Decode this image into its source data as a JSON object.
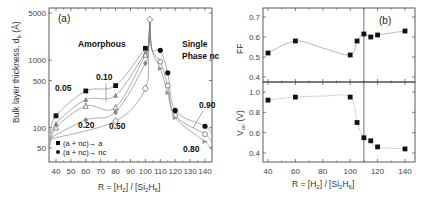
{
  "chart_data": [
    {
      "id": "a",
      "type": "line",
      "panel_label": "(a)",
      "xlabel": "R = [H2] / [Si2H6]",
      "ylabel": "Bulk layer thickness, db (Å)",
      "xlim": [
        35,
        145
      ],
      "ylim": [
        30,
        5000
      ],
      "yscale": "log",
      "x_ticks": [
        40,
        50,
        60,
        70,
        80,
        90,
        100,
        110,
        120,
        130,
        140
      ],
      "y_ticks": [
        50,
        100,
        500,
        1000,
        5000
      ],
      "region_labels": [
        "Amorphous",
        "Single",
        "Phase nc"
      ],
      "legend": [
        {
          "marker": "filled-square",
          "label": "(a + nc)→ a"
        },
        {
          "marker": "filled-circle",
          "label": "(a + nc)→ nc"
        }
      ],
      "legend_position": "bottom-left",
      "series": [
        {
          "name": "0.05",
          "marker": "filled-square",
          "color": "#111111",
          "x": [
            40,
            60,
            80,
            100
          ],
          "y": [
            150,
            350,
            420,
            1500
          ]
        },
        {
          "name": "0.10",
          "marker": "grey-triangle",
          "color": "#888888",
          "x": [
            40,
            60,
            80,
            100
          ],
          "y": [
            115,
            260,
            300,
            1300
          ]
        },
        {
          "name": "0.20",
          "marker": "open-triangle",
          "color": "#666666",
          "x": [
            40,
            60,
            80,
            100
          ],
          "y": [
            100,
            210,
            200,
            1200
          ]
        },
        {
          "name": "0.30",
          "marker": "grey-diamond",
          "color": "#999999",
          "x": [
            60,
            80,
            100
          ],
          "y": [
            130,
            170,
            900
          ]
        },
        {
          "name": "0.50",
          "marker": "open-diamond",
          "color": "#777777",
          "x": [
            80,
            100
          ],
          "y": [
            125,
            380
          ]
        },
        {
          "name": "peak",
          "marker": "open-diamond",
          "color": "#777777",
          "x": [
            103
          ],
          "y": [
            4000
          ]
        },
        {
          "name": "0.90",
          "marker": "filled-circle",
          "color": "#111111",
          "x": [
            110,
            115,
            120,
            140
          ],
          "y": [
            1400,
            650,
            180,
            105
          ]
        },
        {
          "name": "nc-open",
          "marker": "open-circle",
          "color": "#777777",
          "x": [
            110,
            115,
            120,
            140
          ],
          "y": [
            950,
            420,
            150,
            80
          ]
        },
        {
          "name": "0.80",
          "marker": "grey-triangle-right",
          "color": "#999999",
          "x": [
            110,
            115,
            120,
            140
          ],
          "y": [
            750,
            330,
            140,
            62
          ]
        }
      ],
      "annotations": [
        "0.05",
        "0.10",
        "0.20",
        "0.50",
        "0.90",
        "0.80"
      ]
    },
    {
      "id": "b-ff",
      "type": "line",
      "panel_label": "(b)",
      "ylabel": "FF",
      "xlim": [
        35,
        145
      ],
      "ylim": [
        0.38,
        0.75
      ],
      "y_ticks": [
        0.4,
        0.5,
        0.6,
        0.7
      ],
      "vline_x": 110,
      "x": [
        40,
        60,
        100,
        105,
        110,
        115,
        120,
        140
      ],
      "y": [
        0.52,
        0.58,
        0.51,
        0.58,
        0.615,
        0.6,
        0.61,
        0.63
      ]
    },
    {
      "id": "b-voc",
      "type": "line",
      "ylabel": "Voc (V)",
      "xlabel": "R = [H2] / [Si2H6]",
      "xlim": [
        35,
        145
      ],
      "ylim": [
        0.3,
        1.08
      ],
      "y_ticks": [
        0.4,
        0.6,
        0.8,
        1.0
      ],
      "x_ticks": [
        40,
        60,
        80,
        100,
        120,
        140
      ],
      "vline_x": 110,
      "x": [
        40,
        60,
        100,
        105,
        110,
        115,
        120,
        140
      ],
      "y": [
        0.92,
        0.95,
        0.95,
        0.7,
        0.55,
        0.52,
        0.46,
        0.44
      ]
    }
  ],
  "text": {
    "a_panel": "(a)",
    "b_panel": "(b)",
    "amorphous": "Amorphous",
    "single": "Single",
    "phase_nc": "Phase nc",
    "legend_a": "(a + nc)→ a",
    "legend_nc": "(a + nc)→ nc",
    "ylabel_left": "Bulk layer thickness, d",
    "ylabel_left_sub": "b",
    "ylabel_left_unit": " (Å)",
    "xlabel_main": "R = [H",
    "xlabel_sub1": "2",
    "xlabel_mid": "] / [Si",
    "xlabel_sub2": "2",
    "xlabel_h": "H",
    "xlabel_sub3": "6",
    "xlabel_end": "]",
    "ff_label": "FF",
    "voc_label": "V",
    "voc_sub": "oc",
    "voc_unit": " (V)"
  }
}
